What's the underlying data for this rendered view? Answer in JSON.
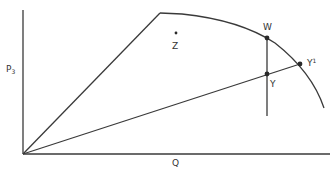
{
  "diagram": {
    "labels": {
      "y_axis": "P",
      "y_axis_sub": "3",
      "x_axis": "Q",
      "point_w": "W",
      "point_z": "Z",
      "point_y": "Y",
      "point_y1": "Y",
      "point_y1_sup": "1"
    },
    "points": {
      "origin": [
        23,
        154
      ],
      "kink": [
        160,
        13
      ],
      "W": [
        267,
        38
      ],
      "Y": [
        267,
        74
      ],
      "Y1": [
        300,
        64
      ],
      "Z": [
        176,
        33
      ],
      "curve_end": [
        324,
        108
      ],
      "vertical_bottom": [
        267,
        116
      ]
    },
    "colors": {
      "line": "#3a3a3a",
      "text": "#333333",
      "background": "#ffffff"
    }
  }
}
